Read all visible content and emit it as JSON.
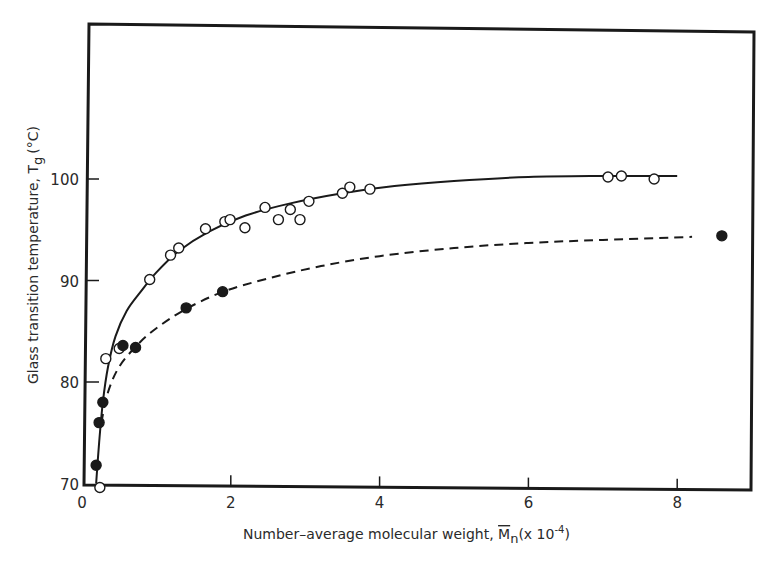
{
  "chart_data": {
    "type": "scatter",
    "title": "",
    "xlabel": "Number-average molecular weight, M̄n (x 10^-4)",
    "xlabel_parts": {
      "main": "Number–average molecular weight, ",
      "symbol": "M",
      "sub": "n",
      "unit_open": "(x 10",
      "exp": "-4",
      "unit_close": ")"
    },
    "ylabel": "Glass transition temperature, Tg (°C)",
    "ylabel_parts": {
      "main": "Glass transition temperature, T",
      "sub": "g",
      "unit": "(°C)"
    },
    "xlim": [
      0,
      9
    ],
    "ylim": [
      70,
      110
    ],
    "x_ticks": [
      0,
      2,
      4,
      6,
      8
    ],
    "x_tick_labels": [
      "0",
      "2",
      "4",
      "6",
      "8"
    ],
    "y_ticks": [
      70,
      80,
      90,
      100
    ],
    "y_tick_labels": [
      "70",
      "80",
      "90",
      "100"
    ],
    "grid": false,
    "legend": null,
    "series": [
      {
        "name": "open circles (solid fit curve)",
        "marker": "open-circle",
        "line": "solid",
        "points": [
          [
            0.24,
            69.6
          ],
          [
            0.32,
            82.3
          ],
          [
            0.5,
            83.3
          ],
          [
            0.91,
            90.1
          ],
          [
            1.19,
            92.5
          ],
          [
            1.3,
            93.2
          ],
          [
            1.66,
            95.1
          ],
          [
            1.92,
            95.8
          ],
          [
            1.99,
            96.0
          ],
          [
            2.19,
            95.2
          ],
          [
            2.46,
            97.2
          ],
          [
            2.64,
            96.0
          ],
          [
            2.8,
            97.0
          ],
          [
            2.93,
            96.0
          ],
          [
            3.05,
            97.8
          ],
          [
            3.5,
            98.6
          ],
          [
            3.6,
            99.2
          ],
          [
            3.87,
            99.0
          ],
          [
            7.07,
            100.2
          ],
          [
            7.25,
            100.3
          ],
          [
            7.69,
            100.0
          ]
        ],
        "curve": [
          [
            0.19,
            70.0
          ],
          [
            0.23,
            74.0
          ],
          [
            0.28,
            78.0
          ],
          [
            0.35,
            81.5
          ],
          [
            0.45,
            84.5
          ],
          [
            0.6,
            87.0
          ],
          [
            0.8,
            89.0
          ],
          [
            1.0,
            90.8
          ],
          [
            1.3,
            92.9
          ],
          [
            1.7,
            94.8
          ],
          [
            2.2,
            96.4
          ],
          [
            2.8,
            97.6
          ],
          [
            3.5,
            98.6
          ],
          [
            4.2,
            99.3
          ],
          [
            5.0,
            99.8
          ],
          [
            6.0,
            100.2
          ],
          [
            7.0,
            100.3
          ],
          [
            8.0,
            100.3
          ]
        ]
      },
      {
        "name": "filled circles (dashed fit curve)",
        "marker": "filled-circle",
        "line": "dashed",
        "points": [
          [
            0.19,
            71.8
          ],
          [
            0.23,
            76.0
          ],
          [
            0.28,
            78.0
          ],
          [
            0.55,
            83.6
          ],
          [
            0.72,
            83.4
          ],
          [
            1.4,
            87.3
          ],
          [
            1.89,
            88.9
          ],
          [
            8.6,
            94.4
          ]
        ],
        "curve": [
          [
            0.26,
            76.0
          ],
          [
            0.35,
            79.0
          ],
          [
            0.5,
            81.5
          ],
          [
            0.75,
            83.7
          ],
          [
            1.0,
            85.3
          ],
          [
            1.4,
            87.2
          ],
          [
            1.9,
            88.9
          ],
          [
            2.5,
            90.2
          ],
          [
            3.2,
            91.4
          ],
          [
            4.0,
            92.4
          ],
          [
            5.0,
            93.2
          ],
          [
            6.0,
            93.7
          ],
          [
            7.0,
            94.0
          ],
          [
            8.2,
            94.3
          ]
        ]
      }
    ]
  }
}
